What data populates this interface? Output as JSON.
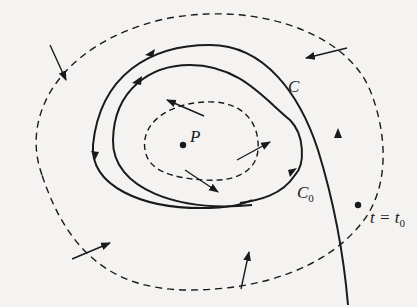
{
  "figure": {
    "type": "phase-portrait",
    "labels": {
      "equilibrium": "P",
      "limit_cycle": "C",
      "trajectory": "C",
      "trajectory_sub": "0",
      "initial_time": "t = t",
      "initial_time_sub": "0"
    },
    "colors": {
      "ink": "#1a1a1a",
      "paper": "#f4f3f1",
      "bleed_text": "#d9d8d5"
    },
    "elements": {
      "outer_dashed_region": "outer dashed boundary curve",
      "inner_dashed_region": "inner dashed boundary curve around P",
      "vector_arrows_outer": 5,
      "vector_arrows_inner": 3
    }
  }
}
